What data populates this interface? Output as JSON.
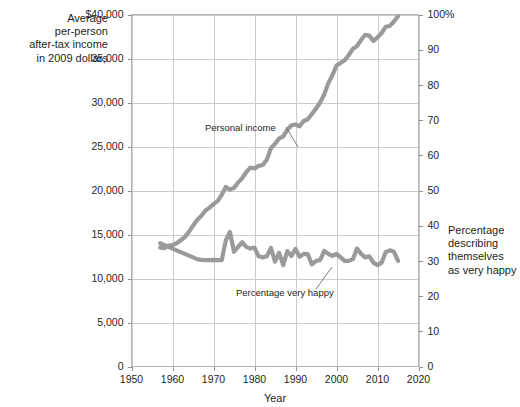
{
  "chart_data": {
    "type": "line",
    "title": "",
    "xlabel": "Year",
    "xlim": [
      1950,
      2020
    ],
    "xticks": [
      1950,
      1960,
      1970,
      1980,
      1990,
      2000,
      2010,
      2020
    ],
    "xticklabels": [
      "1950",
      "1960",
      "1970",
      "1980",
      "1990",
      "2000",
      "2010",
      "2020"
    ],
    "grid": true,
    "legend_position": "inline-annotations",
    "left_axis": {
      "label": "Average\nper-person\nafter-tax income\nin 2009 dollars",
      "ylim": [
        0,
        40000
      ],
      "yticks": [
        0,
        5000,
        10000,
        15000,
        20000,
        25000,
        30000,
        35000,
        40000
      ],
      "yticklabels": [
        "0",
        "5,000",
        "10,000",
        "15,000",
        "20,000",
        "25,000",
        "30,000",
        "35,000",
        "$40,000"
      ]
    },
    "right_axis": {
      "label": "Percentage\ndescribing\nthemselves\nas very happy",
      "ylim": [
        0,
        100
      ],
      "yticks": [
        0,
        10,
        20,
        30,
        40,
        50,
        60,
        70,
        80,
        90,
        100
      ],
      "yticklabels": [
        "0",
        "10",
        "20",
        "30",
        "40",
        "50",
        "60",
        "70",
        "80",
        "90",
        "100%"
      ]
    },
    "series": [
      {
        "name": "Personal income",
        "axis": "left",
        "color": "#9a9a9a",
        "linewidth": 4.2,
        "annotation": "Personal income",
        "x": [
          1957,
          1958,
          1959,
          1960,
          1961,
          1962,
          1963,
          1964,
          1965,
          1966,
          1967,
          1968,
          1969,
          1970,
          1971,
          1972,
          1973,
          1974,
          1975,
          1976,
          1977,
          1978,
          1979,
          1980,
          1981,
          1982,
          1983,
          1984,
          1985,
          1986,
          1987,
          1988,
          1989,
          1990,
          1991,
          1992,
          1993,
          1994,
          1995,
          1996,
          1997,
          1998,
          1999,
          2000,
          2001,
          2002,
          2003,
          2004,
          2005,
          2006,
          2007,
          2008,
          2009,
          2010,
          2011,
          2012,
          2013,
          2014,
          2015
        ],
        "y": [
          13500,
          13450,
          13750,
          13800,
          14000,
          14350,
          14700,
          15300,
          16000,
          16650,
          17100,
          17700,
          18050,
          18450,
          18800,
          19500,
          20400,
          20100,
          20300,
          20900,
          21400,
          22100,
          22600,
          22500,
          22800,
          22900,
          23500,
          24800,
          25300,
          25900,
          26150,
          26900,
          27400,
          27500,
          27300,
          27900,
          28100,
          28700,
          29300,
          30000,
          30900,
          32200,
          33100,
          34200,
          34500,
          34800,
          35400,
          36100,
          36400,
          37100,
          37700,
          37600,
          37000,
          37400,
          37900,
          38600,
          38700,
          39200,
          39800
        ]
      },
      {
        "name": "Percentage very happy",
        "axis": "right",
        "color": "#9a9a9a",
        "linewidth": 4.2,
        "annotation": "Percentage very happy",
        "x": [
          1957,
          1958,
          1959,
          1960,
          1961,
          1962,
          1963,
          1964,
          1965,
          1966,
          1967,
          1968,
          1969,
          1970,
          1971,
          1972,
          1973,
          1974,
          1975,
          1976,
          1977,
          1978,
          1979,
          1980,
          1981,
          1982,
          1983,
          1984,
          1985,
          1986,
          1987,
          1988,
          1989,
          1990,
          1991,
          1992,
          1993,
          1994,
          1995,
          1996,
          1997,
          1998,
          1999,
          2000,
          2001,
          2002,
          2003,
          2004,
          2005,
          2006,
          2007,
          2008,
          2009,
          2010,
          2011,
          2012,
          2013,
          2014,
          2015
        ],
        "y": [
          35.0,
          34.5,
          34.0,
          33.5,
          33.0,
          32.5,
          32.0,
          31.5,
          31.0,
          30.5,
          30.3,
          30.2,
          30.2,
          30.3,
          30.2,
          30.2,
          35.8,
          38.2,
          32.6,
          34.0,
          35.3,
          34.0,
          33.5,
          33.8,
          31.3,
          31.0,
          31.3,
          33.7,
          29.8,
          32.3,
          28.8,
          32.8,
          31.4,
          33.4,
          31.2,
          32.0,
          31.9,
          29.0,
          30.0,
          30.2,
          32.8,
          32.0,
          31.4,
          32.0,
          31.0,
          30.0,
          30.0,
          30.5,
          33.5,
          32.0,
          31.0,
          31.3,
          29.5,
          28.8,
          29.5,
          32.5,
          33.0,
          32.6,
          30.0
        ]
      }
    ],
    "annotations": [
      {
        "text": "Personal income",
        "label_x": 205,
        "label_y": 131,
        "leader": [
          [
            286,
            127
          ],
          [
            298,
            147
          ]
        ]
      },
      {
        "text": "Percentage very happy",
        "label_x": 236,
        "label_y": 296,
        "leader": [
          [
            316,
            289
          ],
          [
            332,
            267
          ]
        ]
      }
    ]
  }
}
